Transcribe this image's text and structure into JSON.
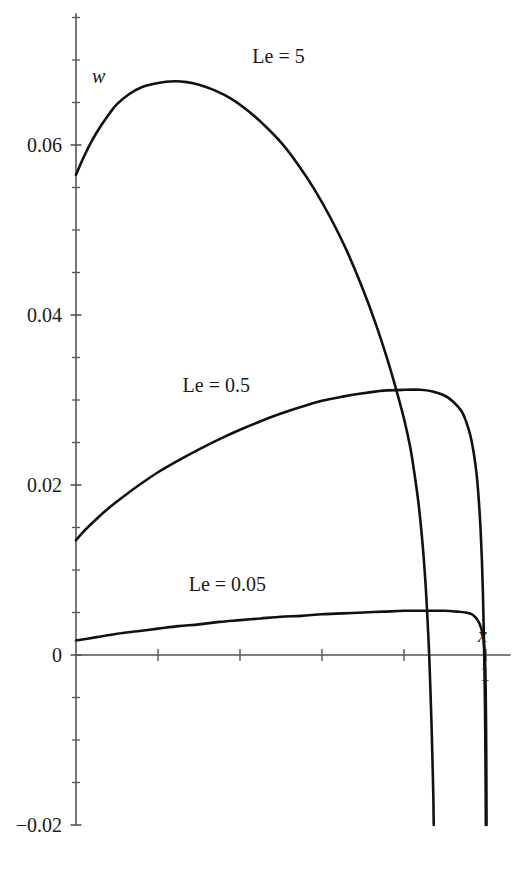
{
  "chart_data": {
    "type": "line",
    "title": "",
    "subtitle": "",
    "xlabel": "x",
    "ylabel": "w",
    "xlim": [
      0,
      1.06
    ],
    "ylim": [
      -0.02,
      0.0755
    ],
    "grid": false,
    "legend_position": "inline-curve-labels",
    "x_ticks_major": [
      0,
      0.2,
      0.4,
      0.6,
      0.8,
      1
    ],
    "x_tick_labels": [
      "",
      "",
      "",
      "",
      "",
      "1"
    ],
    "y_ticks_major": [
      -0.02,
      0,
      0.02,
      0.04,
      0.06
    ],
    "y_tick_labels": [
      "−0.02",
      "0",
      "0.02",
      "0.04",
      "0.06"
    ],
    "y_ticks_minor_step": 0.005,
    "x_axis_label_text": "x",
    "y_axis_label_text": "w",
    "line_color": "#111111",
    "axis_color": "#555555",
    "series": [
      {
        "name": "Le = 5",
        "label": "Le = 5",
        "points": [
          [
            0.0,
            0.0565
          ],
          [
            0.02,
            0.0587
          ],
          [
            0.04,
            0.0606
          ],
          [
            0.06,
            0.0622
          ],
          [
            0.08,
            0.0636
          ],
          [
            0.1,
            0.0648
          ],
          [
            0.13,
            0.066
          ],
          [
            0.16,
            0.0668
          ],
          [
            0.2,
            0.0673
          ],
          [
            0.24,
            0.0675
          ],
          [
            0.27,
            0.0674
          ],
          [
            0.3,
            0.0671
          ],
          [
            0.34,
            0.0664
          ],
          [
            0.38,
            0.0654
          ],
          [
            0.42,
            0.064
          ],
          [
            0.46,
            0.0623
          ],
          [
            0.5,
            0.0603
          ],
          [
            0.54,
            0.0578
          ],
          [
            0.58,
            0.0549
          ],
          [
            0.62,
            0.0515
          ],
          [
            0.66,
            0.0476
          ],
          [
            0.7,
            0.043
          ],
          [
            0.73,
            0.0391
          ],
          [
            0.76,
            0.0347
          ],
          [
            0.78,
            0.0314
          ],
          [
            0.8,
            0.0278
          ],
          [
            0.815,
            0.0245
          ],
          [
            0.825,
            0.0215
          ],
          [
            0.835,
            0.018
          ],
          [
            0.842,
            0.0148
          ],
          [
            0.848,
            0.0115
          ],
          [
            0.853,
            0.008
          ],
          [
            0.857,
            0.0045
          ],
          [
            0.861,
            0.0005
          ],
          [
            0.864,
            -0.0035
          ],
          [
            0.867,
            -0.008
          ],
          [
            0.8695,
            -0.0125
          ],
          [
            0.8715,
            -0.0165
          ],
          [
            0.8725,
            -0.02
          ]
        ]
      },
      {
        "name": "Le = 0.5",
        "label": "Le = 0.5",
        "points": [
          [
            0.0,
            0.0135
          ],
          [
            0.02,
            0.0146
          ],
          [
            0.05,
            0.016
          ],
          [
            0.08,
            0.0173
          ],
          [
            0.12,
            0.0188
          ],
          [
            0.16,
            0.0202
          ],
          [
            0.2,
            0.0215
          ],
          [
            0.25,
            0.0229
          ],
          [
            0.3,
            0.0242
          ],
          [
            0.35,
            0.0254
          ],
          [
            0.4,
            0.0265
          ],
          [
            0.45,
            0.0275
          ],
          [
            0.5,
            0.0284
          ],
          [
            0.55,
            0.0292
          ],
          [
            0.6,
            0.0299
          ],
          [
            0.65,
            0.0304
          ],
          [
            0.7,
            0.0308
          ],
          [
            0.75,
            0.0311
          ],
          [
            0.8,
            0.0312
          ],
          [
            0.84,
            0.0312
          ],
          [
            0.87,
            0.031
          ],
          [
            0.9,
            0.0305
          ],
          [
            0.92,
            0.0298
          ],
          [
            0.94,
            0.0287
          ],
          [
            0.952,
            0.0274
          ],
          [
            0.962,
            0.0258
          ],
          [
            0.97,
            0.0238
          ],
          [
            0.977,
            0.0213
          ],
          [
            0.982,
            0.0185
          ],
          [
            0.9865,
            0.015
          ],
          [
            0.99,
            0.0112
          ],
          [
            0.9925,
            0.0072
          ],
          [
            0.9945,
            0.003
          ],
          [
            0.9962,
            -0.0015
          ],
          [
            0.9975,
            -0.006
          ],
          [
            0.9985,
            -0.011
          ],
          [
            0.9992,
            -0.0158
          ],
          [
            0.9996,
            -0.02
          ]
        ]
      },
      {
        "name": "Le = 0.05",
        "label": "Le = 0.05",
        "points": [
          [
            0.0,
            0.0017
          ],
          [
            0.05,
            0.0021
          ],
          [
            0.1,
            0.0025
          ],
          [
            0.15,
            0.0028
          ],
          [
            0.2,
            0.0031
          ],
          [
            0.25,
            0.0034
          ],
          [
            0.3,
            0.0036
          ],
          [
            0.35,
            0.0039
          ],
          [
            0.4,
            0.0041
          ],
          [
            0.45,
            0.0043
          ],
          [
            0.5,
            0.0045
          ],
          [
            0.55,
            0.0046
          ],
          [
            0.6,
            0.0048
          ],
          [
            0.65,
            0.0049
          ],
          [
            0.7,
            0.005
          ],
          [
            0.75,
            0.0051
          ],
          [
            0.8,
            0.0052
          ],
          [
            0.85,
            0.0052
          ],
          [
            0.9,
            0.0052
          ],
          [
            0.93,
            0.0051
          ],
          [
            0.95,
            0.005
          ],
          [
            0.965,
            0.0048
          ],
          [
            0.975,
            0.0044
          ],
          [
            0.982,
            0.0039
          ],
          [
            0.988,
            0.0032
          ],
          [
            0.992,
            0.0024
          ],
          [
            0.9948,
            0.0014
          ],
          [
            0.9968,
            0.0002
          ],
          [
            0.9982,
            -0.0015
          ],
          [
            0.9992,
            -0.004
          ],
          [
            1.0,
            -0.0075
          ],
          [
            1.0006,
            -0.0115
          ],
          [
            1.001,
            -0.0158
          ],
          [
            1.0013,
            -0.02
          ]
        ]
      }
    ],
    "annotations": [
      {
        "text": "Le = 5",
        "x": 0.43,
        "y": 0.0705
      },
      {
        "text": "Le = 0.5",
        "x": 0.26,
        "y": 0.0318
      },
      {
        "text": "Le = 0.05",
        "x": 0.275,
        "y": 0.0083
      }
    ]
  }
}
